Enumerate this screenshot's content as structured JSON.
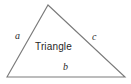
{
  "figure": {
    "kind": "triangle-diagram",
    "background_color": "#ffffff",
    "stroke_color": "#7a7a7a",
    "stroke_width": 1.1,
    "text_color": "#2b2b2b",
    "shape_label": "Triangle",
    "vertices": {
      "apex": [
        48,
        5
      ],
      "bottom_left": [
        7,
        77
      ],
      "bottom_right": [
        125,
        77
      ]
    },
    "sides": [
      {
        "id": "a",
        "label": "a",
        "position": "left",
        "from": "apex",
        "to": "bottom_left"
      },
      {
        "id": "b",
        "label": "b",
        "position": "bottom",
        "from": "bottom_left",
        "to": "bottom_right"
      },
      {
        "id": "c",
        "label": "c",
        "position": "right",
        "from": "apex",
        "to": "bottom_right"
      }
    ]
  }
}
